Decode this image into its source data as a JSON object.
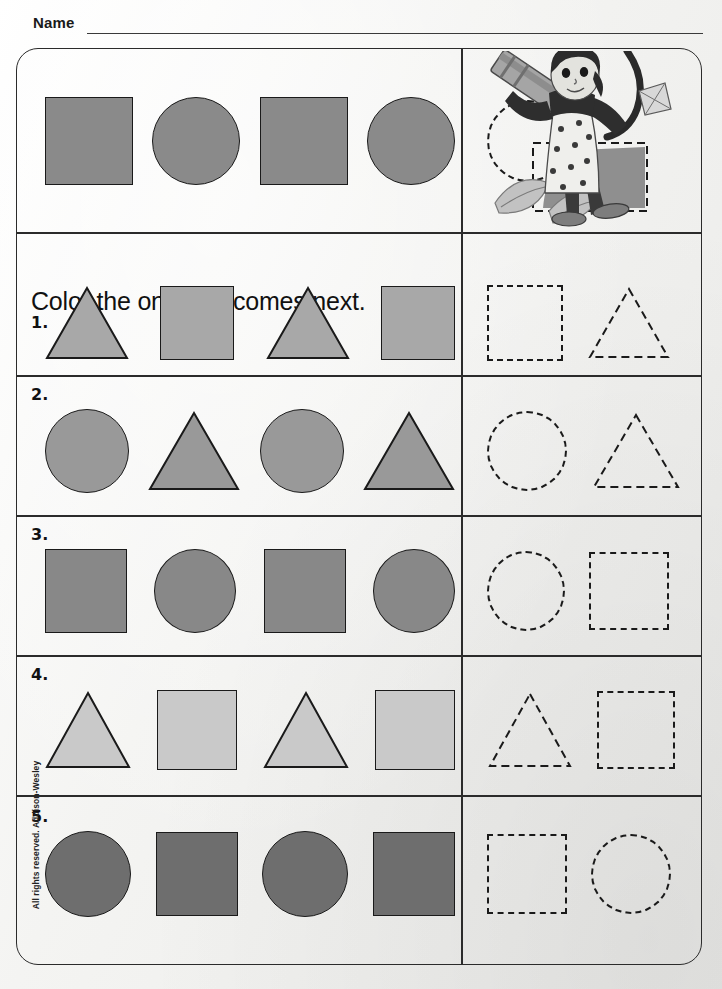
{
  "header": {
    "name_label": "Name"
  },
  "instruction": "Color the one that comes next.",
  "copyright": "All rights reserved.  Addison-Wesley",
  "colors": {
    "page_bg": "#f2f2f0",
    "ink": "#1a1a1a",
    "example_fill": "#8a8a8a",
    "row1_fill": "#a8a8a8",
    "row2_fill": "#999999",
    "row3_fill": "#888888",
    "row4_fill": "#c9c9c9",
    "row5_fill": "#6e6e6e"
  },
  "example": {
    "label": "example-row",
    "pattern": [
      "square",
      "circle",
      "square",
      "circle"
    ],
    "fill": "#8a8a8a",
    "answers": [
      "circle",
      "square"
    ],
    "answer_filled": [
      false,
      true
    ],
    "illustration": "child-with-crayon-illustration"
  },
  "rows": [
    {
      "number": "1.",
      "pattern": [
        "triangle",
        "square",
        "triangle",
        "square"
      ],
      "fill": "#a8a8a8",
      "answers": [
        "square",
        "triangle"
      ]
    },
    {
      "number": "2.",
      "pattern": [
        "circle",
        "triangle",
        "circle",
        "triangle"
      ],
      "fill": "#999999",
      "answers": [
        "circle",
        "triangle"
      ]
    },
    {
      "number": "3.",
      "pattern": [
        "square",
        "circle",
        "square",
        "circle"
      ],
      "fill": "#888888",
      "answers": [
        "circle",
        "square"
      ]
    },
    {
      "number": "4.",
      "pattern": [
        "triangle",
        "square",
        "triangle",
        "square"
      ],
      "fill": "#c9c9c9",
      "answers": [
        "triangle",
        "square"
      ]
    },
    {
      "number": "5.",
      "pattern": [
        "circle",
        "square",
        "circle",
        "square"
      ],
      "fill": "#6e6e6e",
      "answers": [
        "square",
        "circle"
      ]
    }
  ]
}
